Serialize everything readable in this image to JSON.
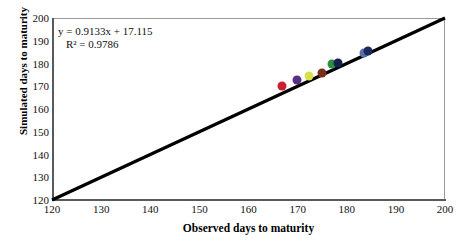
{
  "chart_data": {
    "type": "scatter",
    "title": "",
    "xlabel": "Observed days to maturity",
    "ylabel": "Simulated days to maturity",
    "xlim": [
      120,
      200
    ],
    "ylim": [
      120,
      200
    ],
    "xticks": [
      120,
      130,
      140,
      150,
      160,
      170,
      180,
      190,
      200
    ],
    "yticks": [
      120,
      130,
      140,
      150,
      160,
      170,
      180,
      190,
      200
    ],
    "grid": false,
    "legend": "none",
    "annotations": {
      "equation": "y = 0.9133x + 17.115",
      "r_squared": "R² = 0.9786",
      "slope": 0.9133,
      "intercept": 17.115,
      "r2": 0.9786
    },
    "reference_line": {
      "name": "1:1 line",
      "from": [
        120,
        120
      ],
      "to": [
        200,
        200
      ],
      "color": "#000000"
    },
    "points": [
      {
        "x": 166.8,
        "y": 170.0,
        "color": "#cc1f2e"
      },
      {
        "x": 169.8,
        "y": 172.7,
        "color": "#5b2d83"
      },
      {
        "x": 172.3,
        "y": 174.7,
        "color": "#d6e04a"
      },
      {
        "x": 175.0,
        "y": 175.7,
        "color": "#7a2f18"
      },
      {
        "x": 176.9,
        "y": 180.0,
        "color": "#2f8b3e"
      },
      {
        "x": 178.3,
        "y": 180.2,
        "color": "#14204f"
      },
      {
        "x": 183.6,
        "y": 184.4,
        "color": "#5a6fa8"
      },
      {
        "x": 184.3,
        "y": 185.7,
        "color": "#1b2a5e"
      }
    ]
  },
  "colors": {
    "axis": "#5a5a5a",
    "frame": "#9a9a9a",
    "line": "#000000",
    "text": "#111111",
    "background": "#ffffff"
  }
}
